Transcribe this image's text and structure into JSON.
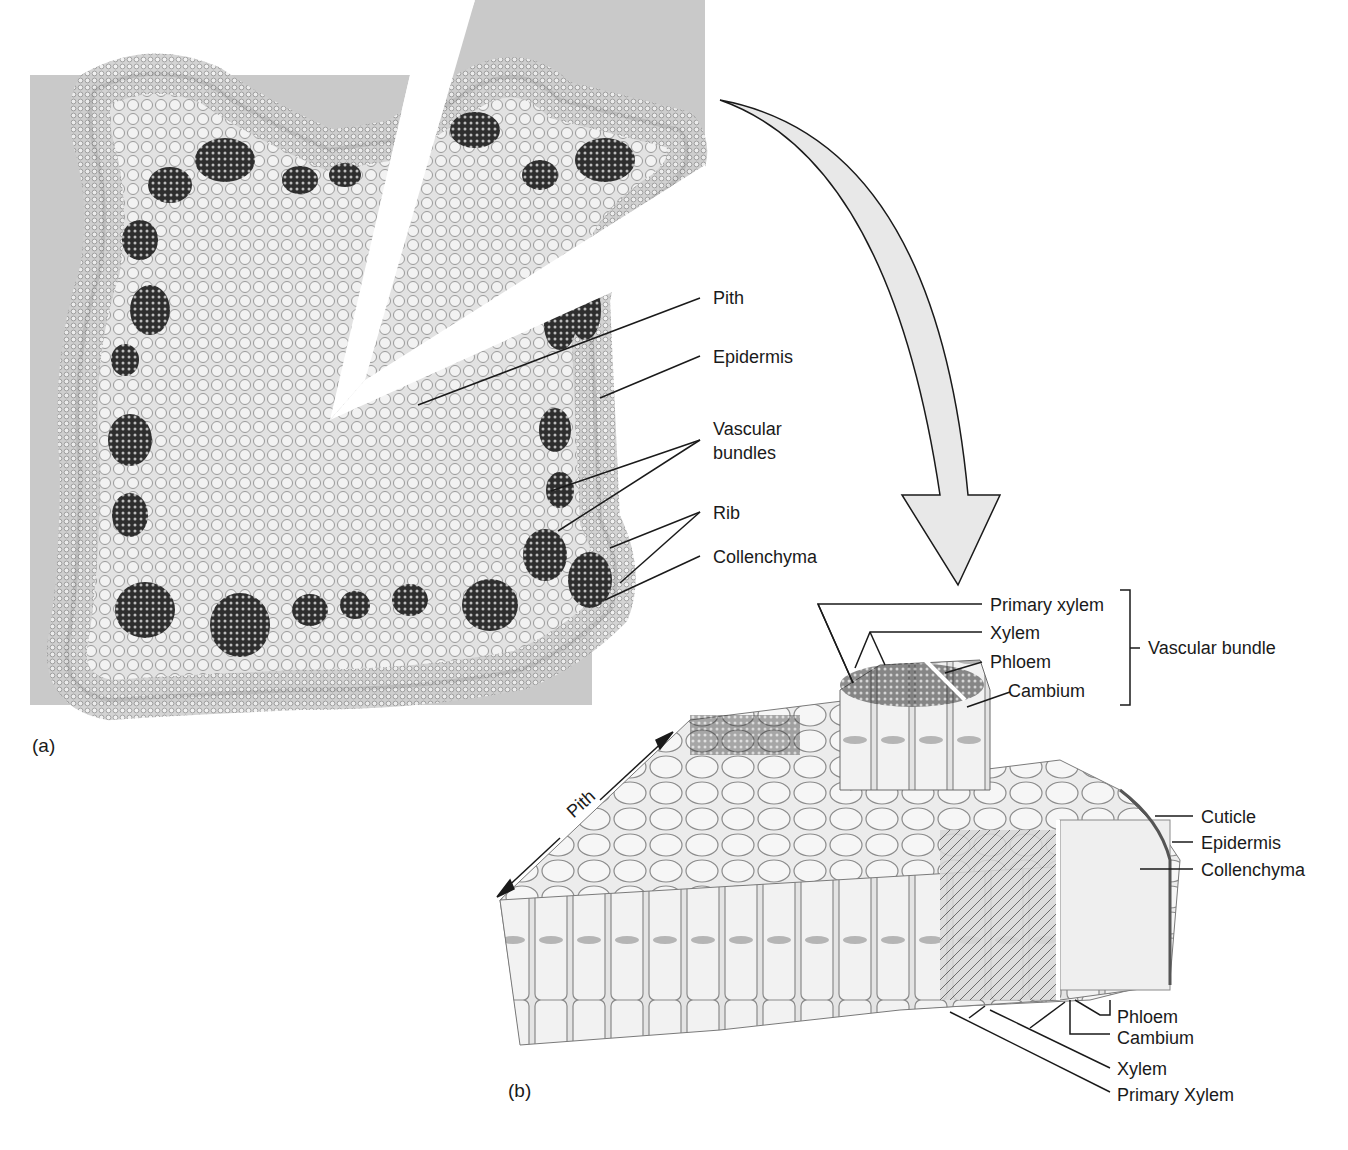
{
  "figure": {
    "panel_a": {
      "panel_label": "(a)",
      "description": "Micrograph cross-section of a square stem with ribs at corners",
      "labels": {
        "pith": "Pith",
        "epidermis": "Epidermis",
        "vascular_bundles_line1": "Vascular",
        "vascular_bundles_line2": "bundles",
        "rib": "Rib",
        "collenchyma": "Collenchyma"
      }
    },
    "panel_b": {
      "panel_label": "(b)",
      "description": "3D block diagram of stem wedge tissues",
      "top_labels": {
        "primary_xylem": "Primary xylem",
        "xylem": "Xylem",
        "phloem": "Phloem",
        "cambium": "Cambium",
        "group_label": "Vascular bundle"
      },
      "right_labels": {
        "cuticle": "Cuticle",
        "epidermis": "Epidermis",
        "collenchyma": "Collenchyma"
      },
      "bottom_labels": {
        "phloem": "Phloem",
        "cambium": "Cambium",
        "xylem": "Xylem",
        "primary_xylem": "Primary Xylem"
      },
      "pith_arrow_label": "Pith"
    },
    "colors": {
      "micrograph_bg": "#c9c9c9",
      "tissue_light": "#e6e6e6",
      "tissue_dark": "#3a3a3a",
      "arrow_fill": "#e8e8e8",
      "line": "#1a1a1a"
    }
  }
}
